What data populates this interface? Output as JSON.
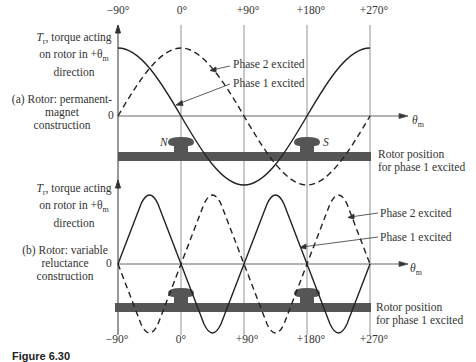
{
  "top_ticks": [
    "−90°",
    "0°",
    "+90°",
    "+180°",
    "+270°"
  ],
  "bottom_ticks": [
    "−90°",
    "0°",
    "+90°",
    "+180°",
    "+270°"
  ],
  "panel_a": {
    "y_label_line1": "T",
    "y_label_sub": "r",
    "y_label_rest1": ", torque acting",
    "y_label_line2": "on rotor in +θ",
    "y_label_sub2": "m",
    "y_label_line3": "direction",
    "title_line1": "(a) Rotor: permanent-",
    "title_line2": "magnet",
    "title_line3": "construction",
    "zero": "0",
    "phase2_label": "Phase 2 excited",
    "phase1_label": "Phase 1 excited",
    "x_axis_label": "θ",
    "x_axis_sub": "m",
    "rotor_label_line1": "Rotor position",
    "rotor_label_line2": "for phase 1 excited",
    "pole_n": "N",
    "pole_s": "S"
  },
  "panel_b": {
    "y_label_line1": "T",
    "y_label_sub": "r",
    "y_label_rest1": ", torque acting",
    "y_label_line2": "on rotor in +θ",
    "y_label_sub2": "m",
    "y_label_line3": "direction",
    "title_line1": "(b) Rotor: variable",
    "title_line2": "reluctance",
    "title_line3": "construction",
    "zero": "0",
    "phase2_label": "Phase 2 excited",
    "phase1_label": "Phase 1 excited",
    "x_axis_label": "θ",
    "x_axis_sub": "m",
    "rotor_label_line1": "Rotor position",
    "rotor_label_line2": "for phase 1 excited"
  },
  "caption": "Figure 6.30"
}
